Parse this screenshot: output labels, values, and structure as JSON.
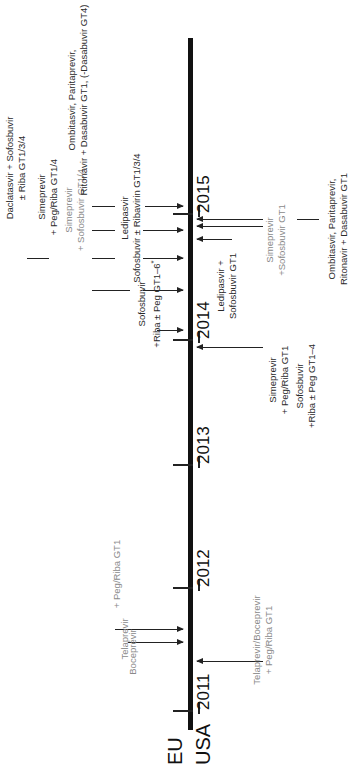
{
  "diagram": {
    "type": "timeline",
    "orientation": "rotated-90-ccw",
    "regions": {
      "top": "EU",
      "bottom": "USA"
    },
    "years": [
      "2011",
      "2012",
      "2013",
      "2014",
      "2015"
    ],
    "colors": {
      "axis": "#111111",
      "dark_text": "#2a2a2a",
      "gray_text": "#8a8a8a"
    },
    "eu_approvals": [
      {
        "id": "eu-telaprevir",
        "lines": [
          "Telaprevir"
        ],
        "style": "gray"
      },
      {
        "id": "eu-boceprevir",
        "lines": [
          "Boceprevir"
        ],
        "style": "gray"
      },
      {
        "id": "eu-peg-riba",
        "lines": [
          "+ Peg/Riba GT1"
        ],
        "style": "gray"
      },
      {
        "id": "eu-sofosbuvir",
        "lines": [
          "Sofosbuvir",
          "+Riba ± Peg GT1–6",
          "*"
        ],
        "style": "dark"
      },
      {
        "id": "eu-simeprevir-peg",
        "lines": [
          "Simeprevir",
          "+ Peg/Riba GT1/4"
        ],
        "style": "dark"
      },
      {
        "id": "eu-simeprevir-sof",
        "lines": [
          "Simeprevir",
          "+ Sofosbuvir GT1/4"
        ],
        "style": "gray"
      },
      {
        "id": "eu-daclatasvir",
        "lines": [
          "Daclatasvir + Sofosbuvir",
          "± Riba GT1/3/4"
        ],
        "style": "dark"
      },
      {
        "id": "eu-ledipasvir",
        "lines": [
          "Ledipasvir",
          "Sofosbuvir ± Ribavirin GT1/3/4"
        ],
        "style": "dark"
      },
      {
        "id": "eu-ombitasvir",
        "lines": [
          "Ombitasvir, Paritaprevir,",
          "Ritonavir + Dasabuvir GT1, (-Dasabuvir GT4)"
        ],
        "style": "dark"
      }
    ],
    "usa_approvals": [
      {
        "id": "usa-telaprevir-boceprevir",
        "lines": [
          "Telaprevir/Boceprevir",
          "+ Peg/Riba GT1"
        ],
        "style": "gray"
      },
      {
        "id": "usa-simeprevir-peg",
        "lines": [
          "Simeprevir",
          "+ Peg/Riba GT1"
        ],
        "style": "dark"
      },
      {
        "id": "usa-sofosbuvir",
        "lines": [
          "Sofosbuvir",
          "+Riba ± Peg GT1–4"
        ],
        "style": "dark"
      },
      {
        "id": "usa-ledipasvir",
        "lines": [
          "Ledipasvir +",
          "Sofosbuvir GT1"
        ],
        "style": "dark"
      },
      {
        "id": "usa-simeprevir-sof",
        "lines": [
          "Simeprevir",
          "+Sofosbuvir GT1"
        ],
        "style": "gray"
      },
      {
        "id": "usa-ombitasvir",
        "lines": [
          "Ombitasvir, Paritaprevir,",
          "Ritonavir + Dasabuvir GT1"
        ],
        "style": "dark"
      }
    ]
  }
}
